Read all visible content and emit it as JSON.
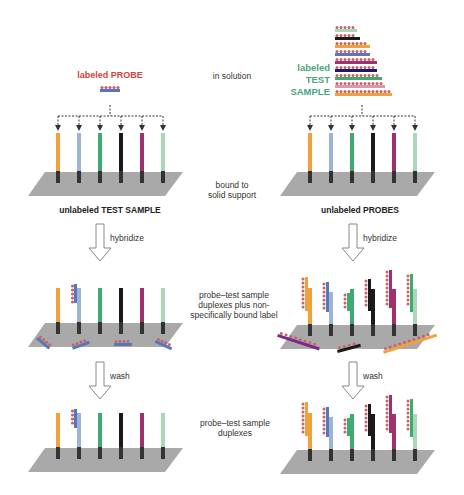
{
  "diagram": {
    "left_panel": {
      "title_top": "labeled PROBE",
      "support_label": "unlabeled TEST SAMPLE",
      "step1_arrow": "hybridize",
      "step2_arrow": "wash"
    },
    "right_panel": {
      "title_top_lines": [
        "labeled",
        "TEST",
        "SAMPLE"
      ],
      "support_label": "unlabeled PROBES",
      "step1_arrow": "hybridize",
      "step2_arrow": "wash"
    },
    "center_labels": {
      "row1": "in solution",
      "row2_line1": "bound to",
      "row2_line2": "solid support",
      "row3_line1": "probe–test sample",
      "row3_line2": "duplexes plus non-",
      "row3_line3": "specifically bound label",
      "row4_line1": "probe–test sample",
      "row4_line2": "duplexes"
    },
    "colors": {
      "strand_colors": [
        "#f0a03c",
        "#9db4d8",
        "#3daa6e",
        "#1a1a1a",
        "#a0306e",
        "#a8d8b8"
      ],
      "label_bead": "#c9636a",
      "probe_strip": "#5577bb",
      "support": "#a9a9a9",
      "label_red": "#d4453a",
      "label_green": "#4aa57a"
    }
  }
}
